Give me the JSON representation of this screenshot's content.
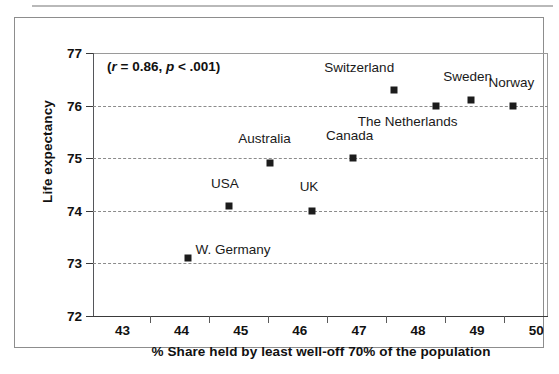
{
  "figure": {
    "annotation_text": "(r = 0.86, p < .001)",
    "annotation_parts": {
      "open": "(",
      "r_symbol": "r",
      "r_value": " = 0.86, ",
      "p_symbol": "p",
      "p_value": " < .001)"
    }
  },
  "chart_data": {
    "type": "scatter",
    "title": "",
    "xlabel": "% Share held by least well-off 70% of the population",
    "ylabel": "Life expectancy",
    "xlim": [
      42.5,
      50.2
    ],
    "ylim": [
      72,
      77
    ],
    "xticks": [
      43,
      44,
      45,
      46,
      47,
      48,
      49,
      50
    ],
    "yticks": [
      72,
      73,
      74,
      75,
      76,
      77
    ],
    "grid": "horizontal-dashed",
    "legend": "none",
    "annotations": [
      {
        "text": "(r = 0.86, p < .001)",
        "r": 0.86,
        "p": "< .001"
      }
    ],
    "point_color": "#1c1c1c",
    "points": [
      {
        "label": "W. Germany",
        "x": 44.1,
        "y": 73.1,
        "label_dx": 8,
        "label_dy": -16
      },
      {
        "label": "USA",
        "x": 44.8,
        "y": 74.1,
        "label_dx": -18,
        "label_dy": -30
      },
      {
        "label": "Australia",
        "x": 45.5,
        "y": 74.9,
        "label_dx": -32,
        "label_dy": -32
      },
      {
        "label": "UK",
        "x": 46.2,
        "y": 74.0,
        "label_dx": -12,
        "label_dy": -32
      },
      {
        "label": "Canada",
        "x": 46.9,
        "y": 75.0,
        "label_dx": -27,
        "label_dy": -30
      },
      {
        "label": "Switzerland",
        "x": 47.6,
        "y": 76.3,
        "label_dx": -70,
        "label_dy": -30
      },
      {
        "label": "The Netherlands",
        "x": 48.3,
        "y": 76.0,
        "label_dx": -78,
        "label_dy": 8
      },
      {
        "label": "Sweden",
        "x": 48.9,
        "y": 76.1,
        "label_dx": -28,
        "label_dy": -31
      },
      {
        "label": "Norway",
        "x": 49.6,
        "y": 76.0,
        "label_dx": -24,
        "label_dy": -31
      }
    ]
  }
}
